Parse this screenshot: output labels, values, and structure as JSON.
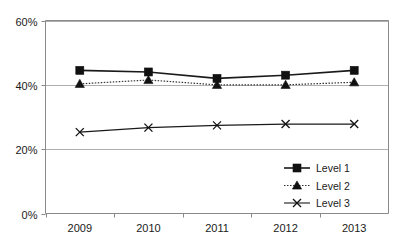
{
  "chart_data": {
    "type": "line",
    "title": "",
    "subtitle": "",
    "xlabel": "",
    "ylabel": "",
    "categories": [
      "2009",
      "2010",
      "2011",
      "2012",
      "2013"
    ],
    "series": [
      {
        "name": "Level 1",
        "marker": "square",
        "line_style": "solid",
        "values": [
          44.5,
          44.0,
          42.0,
          43.0,
          44.5
        ]
      },
      {
        "name": "Level 2",
        "marker": "triangle",
        "line_style": "dotted",
        "values": [
          40.3,
          41.5,
          40.0,
          40.0,
          40.8
        ]
      },
      {
        "name": "Level 3",
        "marker": "x",
        "line_style": "solid",
        "values": [
          25.3,
          26.7,
          27.4,
          27.8,
          27.8
        ]
      }
    ],
    "ylim": [
      0,
      60
    ],
    "ytick_values": [
      0,
      20,
      40,
      60
    ],
    "ytick_labels": [
      "0%",
      "20%",
      "40%",
      "60%"
    ],
    "grid": true,
    "grid_axis": "y",
    "legend_position": "bottom-right",
    "value_suffix": "%"
  },
  "axes": {
    "y": {
      "ticks": [
        {
          "label": "60%",
          "value": 60
        },
        {
          "label": "40%",
          "value": 40
        },
        {
          "label": "20%",
          "value": 20
        },
        {
          "label": "0%",
          "value": 0
        }
      ]
    },
    "x": {
      "ticks": [
        {
          "label": "2009"
        },
        {
          "label": "2010"
        },
        {
          "label": "2011"
        },
        {
          "label": "2012"
        },
        {
          "label": "2013"
        }
      ]
    }
  },
  "legend": {
    "entries": [
      {
        "label": "Level 1",
        "marker": "square"
      },
      {
        "label": "Level 2",
        "marker": "triangle"
      },
      {
        "label": "Level 3",
        "marker": "x"
      }
    ]
  },
  "colors": {
    "series_1": "#1a1a1a",
    "series_2": "#333333",
    "series_3": "#1a1a1a",
    "grid": "#9a9a9a",
    "axis": "#8a8a8a",
    "background": "#ffffff",
    "text": "#1a1a1a"
  }
}
